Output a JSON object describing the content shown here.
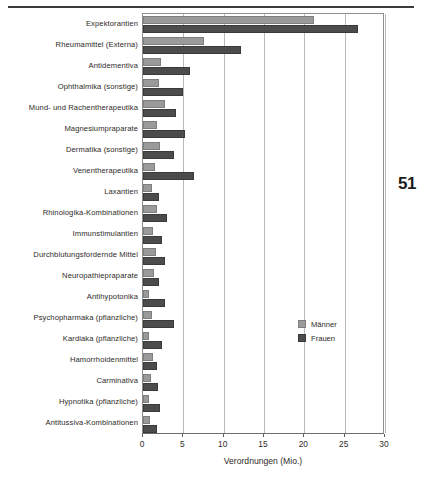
{
  "page": {
    "number": "51"
  },
  "legend": {
    "position": "inside-right",
    "entries": [
      {
        "label": "Männer",
        "color": "#9a9a9a",
        "icon": "legend-swatch-men"
      },
      {
        "label": "Frauen",
        "color": "#4c4c4c",
        "icon": "legend-swatch-women"
      }
    ]
  },
  "axis": {
    "xtitle": "Verordnungen (Mio.)",
    "ticks": [
      "0",
      "5",
      "10",
      "15",
      "20",
      "25",
      "30"
    ]
  },
  "chart_data": {
    "type": "bar",
    "orientation": "horizontal",
    "title": "",
    "subtitle": "",
    "xlabel": "Verordnungen (Mio.)",
    "ylabel": "",
    "xlim": [
      0,
      30
    ],
    "xticks": [
      0,
      5,
      10,
      15,
      20,
      25,
      30
    ],
    "grid": true,
    "grid_axis": "x",
    "legend_position": "inside-right",
    "categories": [
      "Expektorantien",
      "Rheumamittel (Externa)",
      "Antidementiva",
      "Ophthalmika (sonstige)",
      "Mund- und Rachentherapeutika",
      "Magnesiumpraparate",
      "Dermatika (sonstige)",
      "Venentherapeutika",
      "Laxantien",
      "Rhinologika-Kombinationen",
      "Immunstimulantien",
      "Durchblutungsfordernde Mittel",
      "Neuropathiepraparate",
      "Antihypotonika",
      "Psychopharmaka (pflanzliche)",
      "Kardiaka (pflanzliche)",
      "Hamorrhoidenmittel",
      "Carminativa",
      "Hypnotika (pflanzliche)",
      "Antitussiva-Kombinationen"
    ],
    "series": [
      {
        "name": "Männer",
        "color": "#9a9a9a",
        "values": [
          21.2,
          7.5,
          2.2,
          2.0,
          2.7,
          1.7,
          2.1,
          1.5,
          1.1,
          1.7,
          1.3,
          1.6,
          1.4,
          0.8,
          1.1,
          0.7,
          1.2,
          1.0,
          0.8,
          0.9
        ]
      },
      {
        "name": "Frauen",
        "color": "#4c4c4c",
        "values": [
          26.7,
          12.2,
          5.8,
          5.0,
          4.1,
          5.2,
          3.9,
          6.3,
          2.0,
          3.0,
          2.4,
          2.7,
          2.0,
          2.7,
          3.9,
          2.3,
          1.7,
          1.9,
          2.1,
          1.7
        ]
      }
    ]
  }
}
